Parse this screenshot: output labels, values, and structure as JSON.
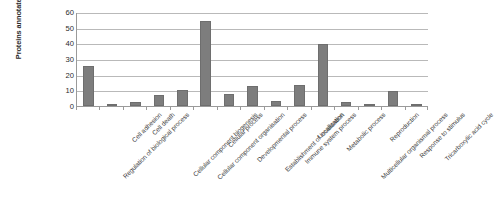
{
  "chart_data": {
    "type": "bar",
    "title": "",
    "xlabel": "",
    "ylabel": "Proteins annotated (%)",
    "ylim": [
      0,
      60
    ],
    "yticks": [
      0,
      10,
      20,
      30,
      40,
      50,
      60
    ],
    "grid": true,
    "legend": "none",
    "bar_color": "#7d7d7d",
    "categories": [
      "Regulation of biological process",
      "Cell adhesion",
      "Cell death",
      "Cellular component biogenesis",
      "Cellular component organisation",
      "Cellular process",
      "Developmental process",
      "Establishment of localisation",
      "Immune system process",
      "Localization",
      "Metabolic process",
      "Multicellular organismal process",
      "Reproduction",
      "Response to stimulus",
      "Tricarboxylic acid cycle"
    ],
    "values": [
      25.5,
      0.5,
      2.5,
      7,
      10.5,
      54.5,
      7.5,
      12.5,
      3.5,
      13.5,
      39.5,
      2.5,
      1,
      9.5,
      0.5
    ]
  }
}
